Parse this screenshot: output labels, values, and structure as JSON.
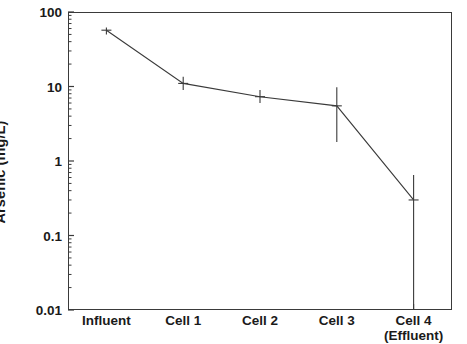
{
  "chart_data": {
    "type": "line",
    "title": "",
    "xlabel": "",
    "ylabel": "Arsenic (mg/L)",
    "yscale": "log",
    "ylim": [
      0.01,
      100
    ],
    "grid": false,
    "legend": null,
    "categories": [
      "Influent",
      "Cell 1",
      "Cell 2",
      "Cell 3",
      "Cell 4 (Effluent)"
    ],
    "category_labels": [
      {
        "line1": "Influent",
        "line2": ""
      },
      {
        "line1": "Cell 1",
        "line2": ""
      },
      {
        "line1": "Cell 2",
        "line2": ""
      },
      {
        "line1": "Cell 3",
        "line2": ""
      },
      {
        "line1": "Cell 4",
        "line2": "(Effluent)"
      }
    ],
    "series": [
      {
        "name": "Arsenic",
        "values": [
          57,
          11,
          7.3,
          5.5,
          0.3
        ],
        "error_low": [
          50,
          9.0,
          6.0,
          1.8,
          0.01
        ],
        "error_high": [
          62,
          13.5,
          9.0,
          9.8,
          0.65
        ]
      }
    ],
    "ytick_labels": [
      "100",
      "10",
      "1",
      "0.1",
      "0.01"
    ],
    "ytick_values": [
      100,
      10,
      1,
      0.1,
      0.01
    ],
    "minor_ticks": true,
    "line_color": "#3a3a3a",
    "axis_color": "#3a3a3a",
    "background_color": "#ffffff"
  }
}
